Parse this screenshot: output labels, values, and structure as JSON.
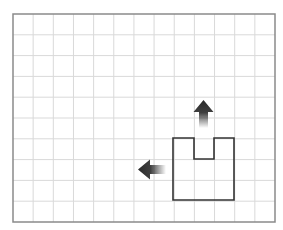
{
  "diagram": {
    "type": "grid-shape-with-arrows",
    "grid": {
      "left": 13,
      "top": 14,
      "right": 275,
      "bottom": 222,
      "columns": 13,
      "rows": 10,
      "line_color": "#d9d9d9",
      "border_color": "#8a8a8a"
    },
    "shape": {
      "name": "u-shape",
      "points": [
        [
          173,
          138
        ],
        [
          194,
          138
        ],
        [
          194,
          159
        ],
        [
          214,
          159
        ],
        [
          214,
          138
        ],
        [
          234,
          138
        ],
        [
          234,
          200
        ],
        [
          173,
          200
        ]
      ],
      "stroke": "#333333",
      "stroke_width": 1.6
    },
    "arrows": [
      {
        "name": "up-arrow",
        "direction": "up",
        "tip": [
          203.5,
          100
        ],
        "tail": [
          203.5,
          128
        ],
        "color": "#2a2a2a"
      },
      {
        "name": "left-arrow",
        "direction": "left",
        "tip": [
          138,
          169.5
        ],
        "tail": [
          166,
          169.5
        ],
        "color": "#2a2a2a"
      }
    ]
  }
}
